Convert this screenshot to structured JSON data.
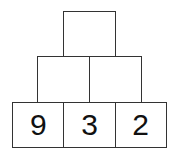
{
  "pyramid": {
    "top": [
      ""
    ],
    "middle": [
      "",
      ""
    ],
    "bottom": [
      "9",
      "3",
      "2"
    ]
  }
}
